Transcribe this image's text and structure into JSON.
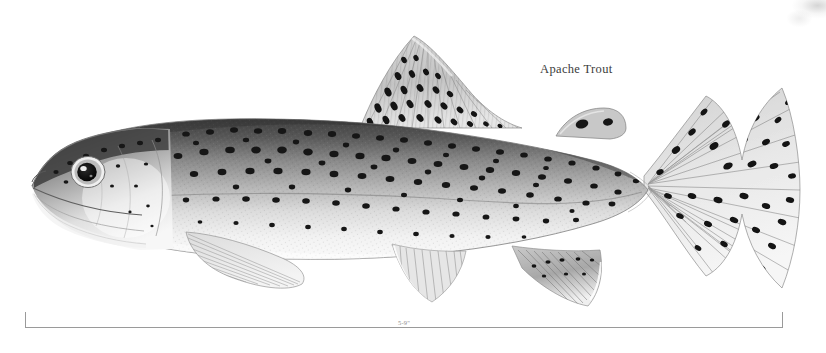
{
  "plate": {
    "width": 826,
    "height": 353,
    "background_color": "#ffffff",
    "medium": "grayscale scientific illustration",
    "orientation": "left-facing lateral view"
  },
  "label": {
    "species_name": "Apache Trout"
  },
  "scale": {
    "size_text": "5-9\"",
    "line_color": "#9a9a9a",
    "text_color": "#8d8d8d"
  },
  "subject": {
    "common_name": "Apache Trout",
    "parts": [
      "snout",
      "mouth",
      "eye",
      "gill-cover",
      "body",
      "lateral-line",
      "dorsal-fin",
      "adipose-fin",
      "caudal-fin",
      "pectoral-fin",
      "pelvic-fin",
      "anal-fin"
    ],
    "palette": {
      "dorsal_dark": "#4a4a4a",
      "mid_body": "#9d9d9d",
      "belly_light": "#f2f2f2",
      "spot_color": "#1b1b1b",
      "outline": "#7c7c7c",
      "fin_tone": "#b8b8b8"
    }
  },
  "artifact": {
    "name": "scan smudge",
    "location": "top-right corner"
  }
}
